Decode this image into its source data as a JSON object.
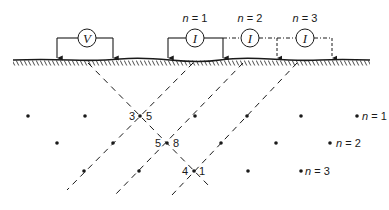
{
  "diagram": {
    "title": "",
    "colors": {
      "ink": "#1a1a1a",
      "background": "#ffffff"
    },
    "voltmeter": {
      "symbol": "V"
    },
    "current_sources": [
      {
        "symbol": "I",
        "label": "n = 1",
        "n_var": "n",
        "n_val": "= 1"
      },
      {
        "symbol": "I",
        "label": "n = 2",
        "n_var": "n",
        "n_val": "= 2"
      },
      {
        "symbol": "I",
        "label": "n = 3",
        "n_var": "n",
        "n_val": "= 3"
      }
    ],
    "pseudosection": {
      "rows": [
        {
          "n_label_var": "n",
          "n_label_val": "= 1"
        },
        {
          "n_label_var": "n",
          "n_label_val": "= 2"
        },
        {
          "n_label_var": "n",
          "n_label_val": "= 3"
        }
      ],
      "annotations": [
        {
          "left": "3",
          "right": "5"
        },
        {
          "left": "5",
          "right": "8"
        },
        {
          "left": "4",
          "right": "1"
        }
      ]
    }
  }
}
